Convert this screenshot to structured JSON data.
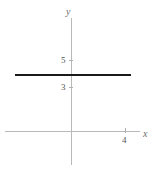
{
  "figure": {
    "background_color": "#ffffff",
    "width": 160,
    "height": 170
  },
  "axes": {
    "x_axis_label": "x",
    "y_axis_label": "y",
    "axis_color": "#b9b9b9",
    "tick_labels": {
      "y_5": "5",
      "y_3": "3",
      "x_4": "4"
    }
  },
  "series": {
    "constant_line": {
      "color": "#1a1a1a",
      "value_label": "4"
    }
  },
  "chart_data": {
    "type": "line",
    "title": "",
    "subtitle": "",
    "xlabel": "x",
    "ylabel": "y",
    "xlim": [
      -5,
      6
    ],
    "ylim": [
      -5,
      9
    ],
    "grid": false,
    "legend": null,
    "xticks": [
      4
    ],
    "xticklabels": [
      "4"
    ],
    "yticks": [
      3,
      5
    ],
    "yticklabels": [
      "3",
      "5"
    ],
    "series": [
      {
        "name": "y = 4",
        "type": "line",
        "color": "#1a1a1a",
        "linewidth": 2,
        "x": [
          -4.2,
          4.4
        ],
        "y": [
          4,
          4
        ]
      }
    ],
    "annotations": []
  }
}
